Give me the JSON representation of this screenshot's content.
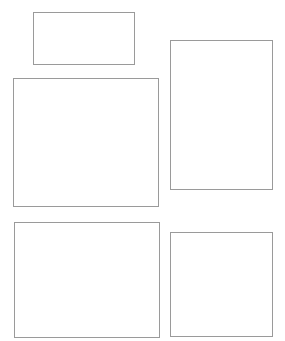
{
  "canvas": {
    "width": 285,
    "height": 341,
    "background": "#ffffff",
    "stroke_color": "#9a9a9a"
  },
  "shapes": [
    {
      "id": "rect-top-left-small",
      "type": "rectangle",
      "x": 33,
      "y": 12,
      "w": 102,
      "h": 53
    },
    {
      "id": "rect-right-tall",
      "type": "rectangle",
      "x": 170,
      "y": 40,
      "w": 103,
      "h": 150
    },
    {
      "id": "rect-left-large",
      "type": "rectangle",
      "x": 13,
      "y": 78,
      "w": 146,
      "h": 129
    },
    {
      "id": "rect-bottom-left",
      "type": "rectangle",
      "x": 14,
      "y": 222,
      "w": 146,
      "h": 116
    },
    {
      "id": "rect-bottom-right",
      "type": "rectangle",
      "x": 170,
      "y": 232,
      "w": 103,
      "h": 105
    }
  ]
}
